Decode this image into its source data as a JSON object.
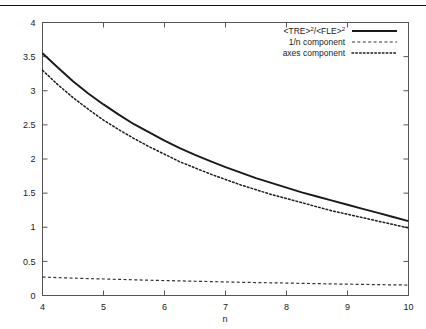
{
  "chart_data": {
    "type": "line",
    "title": "",
    "xlabel": "n",
    "ylabel": "",
    "xlim": [
      4,
      10
    ],
    "ylim": [
      0,
      4
    ],
    "grid": false,
    "legend_position": "top-right",
    "xticks": [
      "4",
      "5",
      "6",
      "7",
      "8",
      "9",
      "10"
    ],
    "xtick_values": [
      4,
      5,
      6,
      7,
      8,
      9,
      10
    ],
    "yticks": [
      "0",
      "0.5",
      "1",
      "1.5",
      "2",
      "2.5",
      "3",
      "3.5",
      "4"
    ],
    "ytick_values": [
      0,
      0.5,
      1,
      1.5,
      2,
      2.5,
      3,
      3.5,
      4
    ],
    "x": [
      4,
      4.25,
      4.5,
      4.75,
      5,
      5.25,
      5.5,
      5.75,
      6,
      6.25,
      6.5,
      6.75,
      7,
      7.25,
      7.5,
      7.75,
      8,
      8.25,
      8.5,
      8.75,
      9,
      9.25,
      9.5,
      9.75,
      10
    ],
    "series": [
      {
        "name": "<TRE>2/<FLE>2",
        "name_base": "<TRE>",
        "name_sup1": "2",
        "name_mid": "/<FLE>",
        "name_sup2": "2",
        "style": "solid",
        "color": "#1a1a1a",
        "values": [
          3.55,
          3.34,
          3.14,
          2.96,
          2.8,
          2.65,
          2.51,
          2.39,
          2.27,
          2.16,
          2.06,
          1.97,
          1.88,
          1.8,
          1.72,
          1.65,
          1.58,
          1.51,
          1.45,
          1.39,
          1.33,
          1.27,
          1.21,
          1.15,
          1.09
        ]
      },
      {
        "name": "1/n component",
        "style": "dashed",
        "color": "#333333",
        "values": [
          0.27,
          0.262,
          0.255,
          0.248,
          0.242,
          0.236,
          0.23,
          0.224,
          0.219,
          0.214,
          0.209,
          0.204,
          0.199,
          0.194,
          0.19,
          0.186,
          0.182,
          0.178,
          0.174,
          0.17,
          0.166,
          0.163,
          0.159,
          0.156,
          0.153
        ]
      },
      {
        "name": "axes component",
        "style": "dotted",
        "color": "#1a1a1a",
        "values": [
          3.3,
          3.09,
          2.9,
          2.73,
          2.57,
          2.43,
          2.3,
          2.18,
          2.07,
          1.96,
          1.87,
          1.78,
          1.7,
          1.62,
          1.55,
          1.48,
          1.42,
          1.36,
          1.3,
          1.24,
          1.19,
          1.14,
          1.09,
          1.04,
          0.99
        ]
      }
    ]
  },
  "legend": {
    "entries": [
      {
        "label": "<TRE>2/<FLE>2",
        "style": "solid"
      },
      {
        "label": "1/n component",
        "style": "dashed"
      },
      {
        "label": "axes component",
        "style": "dotted"
      }
    ],
    "item1_base": "<TRE>",
    "item1_sup1": "2",
    "item1_mid": "/<FLE>",
    "item1_sup2": "2",
    "item2_label": "1/n component",
    "item3_label": "axes component"
  },
  "axis": {
    "x_title": "n"
  }
}
